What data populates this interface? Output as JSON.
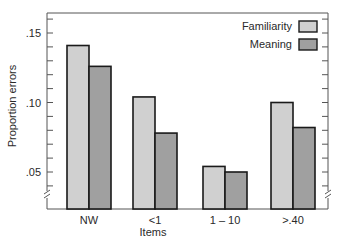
{
  "chart_data": {
    "type": "bar",
    "title": "",
    "xlabel": "Items",
    "ylabel": "Proportion errors",
    "categories": [
      "NW",
      "<1",
      "1 – 10",
      ">.40"
    ],
    "series": [
      {
        "name": "Familiarity",
        "values": [
          0.141,
          0.104,
          0.054,
          0.1
        ],
        "color": "#d0d0d0"
      },
      {
        "name": "Meaning",
        "values": [
          0.126,
          0.078,
          0.05,
          0.082
        ],
        "color": "#a0a0a0"
      }
    ],
    "yticks": [
      0.05,
      0.1,
      0.15
    ],
    "ytick_labels": [
      ".05",
      ".10",
      ".15"
    ],
    "ylim": [
      0.0265,
      0.164
    ],
    "y_axis_break": true,
    "minor_tick_step": 0.01,
    "grid": false,
    "legend_position": "upper right (inside)"
  },
  "colors": {
    "axis": "#555555",
    "bar_outline": "#1a1a1a",
    "familiarity": "#d0d0d0",
    "meaning": "#a0a0a0",
    "text": "#2a2a2a"
  }
}
